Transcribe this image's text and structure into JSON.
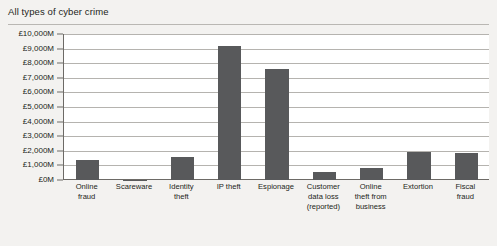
{
  "figure": {
    "title": "All types of cyber crime",
    "bar_color": "#58595b",
    "gridline_color": "#b5b3af",
    "axis_color": "#6d6a66",
    "plot_background": "#ffffff",
    "page_background": "#f3f2f0"
  },
  "chart_data": {
    "type": "bar",
    "title": "All types of cyber crime",
    "xlabel": "",
    "ylabel": "",
    "ylim": [
      0,
      10000
    ],
    "y_tick_step": 1000,
    "y_tick_labels": [
      "£10,000M",
      "£9,000M",
      "£8,000M",
      "£7,000M",
      "£6,000M",
      "£5,000M",
      "£4,000M",
      "£3,000M",
      "£2,000M",
      "£1,000M",
      "£0M"
    ],
    "y_tick_values": [
      10000,
      9000,
      8000,
      7000,
      6000,
      5000,
      4000,
      3000,
      2000,
      1000,
      0
    ],
    "units": "£M",
    "grid": true,
    "legend": false,
    "categories": [
      "Online fraud",
      "Scareware",
      "Identity theft",
      "IP theft",
      "Espionage",
      "Customer data loss (reported)",
      "Online theft from business",
      "Extortion",
      "Fiscal fraud"
    ],
    "category_label_lines": [
      [
        "Online",
        "fraud"
      ],
      [
        "Scareware"
      ],
      [
        "Identity",
        "theft"
      ],
      [
        "IP theft"
      ],
      [
        "Espionage"
      ],
      [
        "Customer",
        "data loss",
        "(reported)"
      ],
      [
        "Online",
        "theft from",
        "business"
      ],
      [
        "Extortion"
      ],
      [
        "Fiscal",
        "fraud"
      ]
    ],
    "values": [
      1350,
      20,
      1600,
      9150,
      7600,
      550,
      850,
      1900,
      1850
    ]
  },
  "bottom_bleed_text": ""
}
